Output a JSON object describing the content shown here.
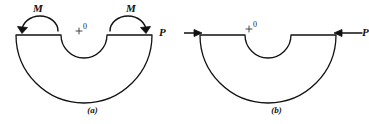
{
  "figure": {
    "panels": [
      {
        "id": "a",
        "caption": "(a)",
        "center_marker": "+",
        "center_label": "0",
        "load_type": "moment",
        "loads": [
          {
            "label": "M",
            "side": "left",
            "sense": "counterclockwise-arc"
          },
          {
            "label": "M",
            "side": "right",
            "sense": "clockwise-arc"
          }
        ]
      },
      {
        "id": "b",
        "caption": "(b)",
        "center_marker": "+",
        "center_label": "0",
        "load_type": "force",
        "loads": [
          {
            "label": "P",
            "side": "left",
            "sense": "arrow-right"
          },
          {
            "label": "P",
            "side": "right",
            "sense": "arrow-left"
          }
        ]
      }
    ],
    "stroke_color": "#111111",
    "background_color": "#ffffff"
  }
}
